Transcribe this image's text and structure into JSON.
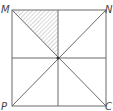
{
  "diagram": {
    "type": "geometry-square",
    "vertices": {
      "top_left": "M",
      "top_right": "N",
      "bottom_left": "P",
      "bottom_right": "C"
    },
    "features": [
      "diagonals",
      "midlines",
      "center-point"
    ],
    "shaded_region": "triangle between M, top-edge midpoint, and center",
    "colors": {
      "line": "#6a6a6a",
      "hatch": "#9a9a9a",
      "label": "#444444",
      "background": "#ffffff"
    }
  }
}
